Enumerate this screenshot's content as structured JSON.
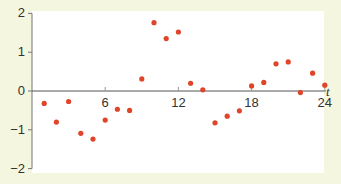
{
  "chart_data": {
    "type": "scatter",
    "title": "",
    "xlabel": "t",
    "ylabel": "",
    "xlim": [
      0,
      24
    ],
    "ylim": [
      -2,
      2
    ],
    "x_ticks": [
      6,
      12,
      18,
      24
    ],
    "x_tick_labels": [
      "6",
      "12",
      "18",
      "24"
    ],
    "y_ticks": [
      2,
      1,
      0,
      -1,
      -2
    ],
    "y_tick_labels": [
      "2",
      "1",
      "0",
      "−1",
      "−2"
    ],
    "grid": false,
    "legend": null,
    "point_color": "#e0452a",
    "axis_color": "#555555",
    "plot_background": "#ffffff",
    "page_background": "#f4f6df",
    "series": [
      {
        "name": "data",
        "x": [
          1,
          2,
          3,
          4,
          5,
          6,
          7,
          8,
          9,
          10,
          11,
          12,
          13,
          14,
          15,
          16,
          17,
          18,
          19,
          20,
          21,
          22,
          23,
          24
        ],
        "y": [
          -0.32,
          -0.8,
          -0.27,
          -1.09,
          -1.24,
          -0.75,
          -0.47,
          -0.5,
          0.31,
          1.76,
          1.35,
          1.52,
          0.2,
          0.03,
          -0.82,
          -0.65,
          -0.51,
          0.13,
          0.22,
          0.7,
          0.75,
          -0.04,
          0.46,
          0.15
        ]
      }
    ]
  }
}
